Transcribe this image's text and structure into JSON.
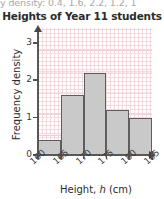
{
  "cutoff_text": "y density: 0.4, 1.6, 2.2, 1.2, 1",
  "axis_titles": {
    "y": "Frequency density",
    "x_before": "Height, ",
    "x_var": "h",
    "x_after": " (cm)"
  },
  "chart_data": {
    "type": "bar",
    "title": "Heights of Year 11 students",
    "xlabel": "Height, h (cm)",
    "ylabel": "Frequency density",
    "bin_edges": [
      160,
      165,
      170,
      175,
      180,
      185
    ],
    "categories": [
      "160-165",
      "165-170",
      "170-175",
      "175-180",
      "180-185"
    ],
    "values": [
      0.4,
      1.6,
      2.2,
      1.2,
      1.0
    ],
    "xlim": [
      160,
      185
    ],
    "ylim": [
      0,
      3.4
    ],
    "x_ticks": [
      "160",
      "165",
      "170",
      "175",
      "180",
      "185"
    ],
    "y_ticks": [
      "0",
      "1",
      "2",
      "3"
    ],
    "grid": true,
    "legend": "none",
    "bar_color": "#c9c9c9",
    "bar_edge_color": "#5d5d5d",
    "grid_color": "#e7c4ca"
  }
}
